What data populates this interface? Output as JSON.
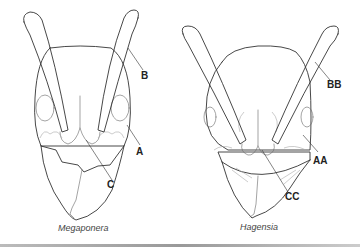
{
  "figure": {
    "panels": [
      {
        "id": "left",
        "caption": "Megaponera",
        "labels": {
          "antenna": "B",
          "eye_region": "A",
          "clypeus": "C"
        }
      },
      {
        "id": "right",
        "caption": "Hagensia",
        "labels": {
          "antenna": "BB",
          "eye_region": "AA",
          "clypeus": "CC"
        }
      }
    ]
  }
}
